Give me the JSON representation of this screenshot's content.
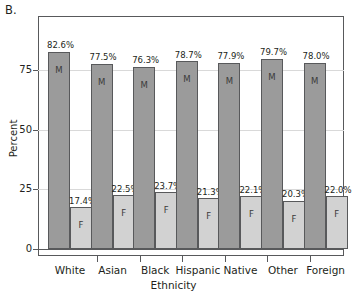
{
  "panel_label": "B.",
  "chart_data": {
    "type": "bar",
    "title": "",
    "subtitle": "",
    "xlabel": "Ethnicity",
    "ylabel": "Percent",
    "ylim": [
      0,
      87
    ],
    "yticks": [
      0,
      25,
      50,
      75
    ],
    "ytick_labels": [
      "0",
      "25",
      "50",
      "75"
    ],
    "grid": true,
    "grid_axis": "y",
    "legend": "none",
    "categories": [
      "White",
      "Asian",
      "Black",
      "Hispanic",
      "Native",
      "Other",
      "Foreign"
    ],
    "series": [
      {
        "name": "M",
        "letter": "M",
        "color": "#9b9b9b",
        "values": [
          82.6,
          77.5,
          76.3,
          78.7,
          77.9,
          79.7,
          78.0
        ],
        "labels": [
          "82.6%",
          "77.5%",
          "76.3%",
          "78.7%",
          "77.9%",
          "79.7%",
          "78.0%"
        ]
      },
      {
        "name": "F",
        "letter": "F",
        "color": "#d2d2d2",
        "values": [
          17.4,
          22.5,
          23.7,
          21.3,
          22.1,
          20.3,
          22.0
        ],
        "labels": [
          "17.4%",
          "22.5%",
          "23.7%",
          "21.3%",
          "22.1%",
          "20.3%",
          "22.0%"
        ]
      }
    ]
  },
  "colors": {
    "male_bar": "#9b9b9b",
    "female_bar": "#d2d2d2",
    "outline": "#58595b",
    "gridline": "#d9d9d9",
    "text": "#231f20",
    "background": "#ffffff"
  }
}
